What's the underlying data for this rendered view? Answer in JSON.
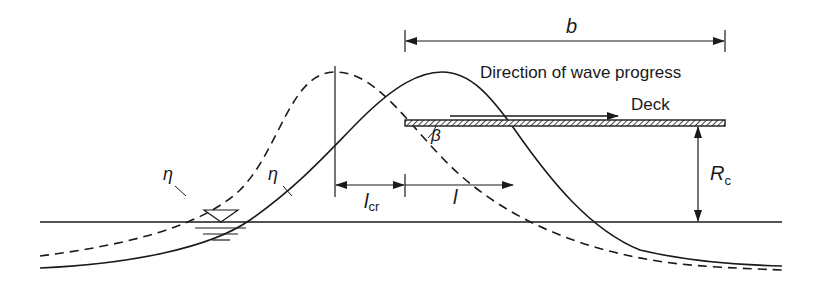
{
  "diagram": {
    "labels": {
      "width": "b",
      "direction": "Direction of wave progress",
      "deck": "Deck",
      "angle": "β",
      "eta_dashed": "η",
      "eta_solid": "η",
      "clearance_main": "R",
      "clearance_sub": "c",
      "lcr_main": "l",
      "lcr_sub": "cr",
      "l": "l"
    },
    "colors": {
      "line": "#1a1a1a",
      "background": "#ffffff"
    },
    "elements": [
      "dashed wave profile (earlier position)",
      "solid wave profile (later position)",
      "still water level with water-level symbol",
      "deck plate (hatched)",
      "dimension b across deck",
      "clearance R_c between deck and still water level",
      "distance l_cr and l along the wave",
      "angle β between wave front and deck"
    ]
  }
}
